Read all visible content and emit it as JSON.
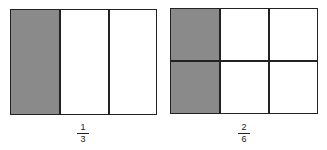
{
  "figures": [
    {
      "id": "one-third",
      "rows": 1,
      "cols": 3,
      "shaded_cells": [
        [
          0,
          0
        ]
      ],
      "fraction": {
        "numerator": "1",
        "denominator": "3"
      }
    },
    {
      "id": "two-sixths",
      "rows": 2,
      "cols": 3,
      "shaded_cells": [
        [
          0,
          0
        ],
        [
          1,
          0
        ]
      ],
      "fraction": {
        "numerator": "2",
        "denominator": "6"
      }
    }
  ],
  "colors": {
    "shade": "#8a8a8a",
    "line": "#222222",
    "background": "#ffffff"
  }
}
